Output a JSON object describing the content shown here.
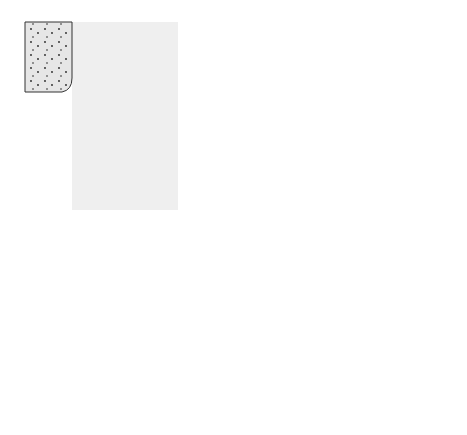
{
  "diagram": {
    "regions": {
      "tubular_urine": "Tubular urine",
      "distal_tubule_cells": "Distal tubule cells",
      "blood_capillary": "Blood capillary"
    },
    "labels": {
      "nacl": "NaCl",
      "nacl_desc": "(neutral salt)",
      "h2co3": "H₂CO₃",
      "nahco3": "NaHCO₃",
      "nahco3_desc": "(basic salt)",
      "glutamine": "Glutamine",
      "glutamine_desc": "amino acid",
      "nh4cl": "NH₄Cl",
      "nh4cl_desc": "(acid salt)"
    },
    "ions": {
      "na_urine": "Na⁺",
      "cl_urine": "Cl⁻",
      "h_urine": "H⁺",
      "h_cell": "H⁺",
      "hco3_cell": "HCO₃⁻",
      "na_cell": "Na⁺",
      "nh3_urine": "NH₃",
      "nh3_cell": "NH₃"
    },
    "colors": {
      "dark_ion": "#6e6e6e",
      "capillary": "#7a7a7a",
      "cell_fill": "#dcdcdc",
      "urine_fill": "#efefef",
      "stipple_fill": "#e6e6e6"
    }
  }
}
